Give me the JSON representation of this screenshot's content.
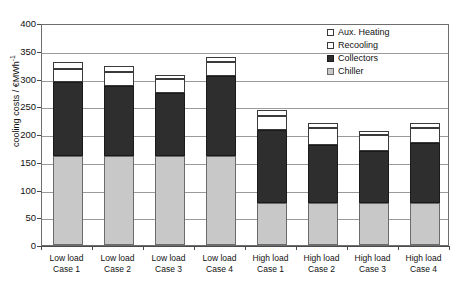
{
  "chart_data": {
    "type": "bar",
    "stacked": true,
    "title": "",
    "xlabel": "",
    "ylabel": "cooling costs / €MWh",
    "ylabel_sup": "-1",
    "ylim": [
      0,
      400
    ],
    "ytick_step": 50,
    "yticks": [
      "400",
      "350",
      "300",
      "250",
      "200",
      "150",
      "100",
      "50",
      "0"
    ],
    "grid": true,
    "grid_axis": "y",
    "legend_position": "top-right",
    "categories": [
      "Low load\nCase 1",
      "Low load\nCase 2",
      "Low load\nCase 3",
      "Low load\nCase 4",
      "High load\nCase 1",
      "High load\nCase 2",
      "High load\nCase 3",
      "High load\nCase 4"
    ],
    "category_lines": [
      [
        "Low load",
        "Case 1"
      ],
      [
        "Low load",
        "Case 2"
      ],
      [
        "Low load",
        "Case 3"
      ],
      [
        "Low load",
        "Case 4"
      ],
      [
        "High load",
        "Case 1"
      ],
      [
        "High load",
        "Case 2"
      ],
      [
        "High load",
        "Case 3"
      ],
      [
        "High load",
        "Case 4"
      ]
    ],
    "series": [
      {
        "name": "Chiller",
        "color": "#c8c8c8",
        "values": [
          161,
          161,
          161,
          161,
          75,
          75,
          76,
          76
        ]
      },
      {
        "name": "Collectors",
        "color": "#2e2e2e",
        "values": [
          132,
          125,
          113,
          144,
          133,
          106,
          93,
          108
        ]
      },
      {
        "name": "Recooling",
        "color": "#ffffff",
        "values": [
          25,
          26,
          25,
          25,
          24,
          30,
          29,
          26
        ]
      },
      {
        "name": "Aux. Heating",
        "color": "#ffffff",
        "values": [
          12,
          10,
          8,
          9,
          11,
          8,
          7,
          9
        ]
      }
    ],
    "cumulative_tops": {
      "chiller": [
        161,
        161,
        161,
        161,
        75,
        75,
        76,
        76
      ],
      "collectors": [
        293,
        286,
        274,
        305,
        208,
        181,
        169,
        184
      ],
      "recooling": [
        318,
        312,
        299,
        330,
        232,
        211,
        198,
        210
      ],
      "aux_heating": [
        330,
        322,
        307,
        339,
        243,
        219,
        205,
        219
      ]
    },
    "totals": [
      330,
      322,
      307,
      339,
      243,
      219,
      205,
      219
    ]
  },
  "legend": {
    "items": [
      {
        "label": "Aux. Heating",
        "swatch": "aux-heating-swatch"
      },
      {
        "label": "Recooling",
        "swatch": "recooling-swatch"
      },
      {
        "label": "Collectors",
        "swatch": "collectors-swatch"
      },
      {
        "label": "Chiller",
        "swatch": "chiller-swatch"
      }
    ]
  }
}
